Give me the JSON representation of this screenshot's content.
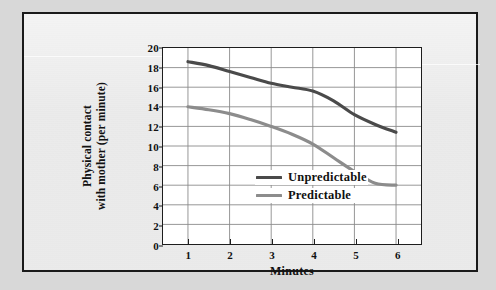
{
  "figure": {
    "background_color": "#d8d8d8",
    "plate_color": "#e6e6e6",
    "border_color": "#1a1a1a"
  },
  "chart_data": {
    "type": "line",
    "title": "",
    "subtitle": "",
    "xlabel": "Minutes",
    "ylabel": "Physical contact with mother (per minute)",
    "ylabel_line1": "Physical contact",
    "ylabel_line2": "with mother (per minute)",
    "xlim": [
      0.4,
      6.6
    ],
    "ylim": [
      0,
      20
    ],
    "x_ticks": [
      1,
      2,
      3,
      4,
      5,
      6
    ],
    "x_tick_labels": [
      "1",
      "2",
      "3",
      "4",
      "5",
      "6"
    ],
    "y_ticks": [
      0,
      2,
      4,
      6,
      8,
      10,
      12,
      14,
      16,
      18,
      20
    ],
    "y_tick_labels": [
      "0",
      "2",
      "4",
      "6",
      "8",
      "10",
      "12",
      "14",
      "16",
      "18",
      "20"
    ],
    "grid": true,
    "grid_color": "#8a8a8a",
    "legend_position": "center",
    "x": [
      1,
      1.5,
      2,
      2.5,
      3,
      3.5,
      4,
      4.5,
      5,
      5.5,
      6
    ],
    "series": [
      {
        "name": "Unpredictable",
        "color": "#4a4a4a",
        "values": [
          18.6,
          18.2,
          17.6,
          17.0,
          16.4,
          16.0,
          15.6,
          14.6,
          13.2,
          12.2,
          11.4
        ]
      },
      {
        "name": "Predictable",
        "color": "#8c8c8c",
        "values": [
          14.0,
          13.7,
          13.3,
          12.7,
          12.0,
          11.2,
          10.2,
          8.8,
          7.4,
          6.2,
          6.0
        ]
      }
    ]
  },
  "legend": {
    "items": [
      {
        "label": "Unpredictable",
        "color": "#4a4a4a"
      },
      {
        "label": "Predictable",
        "color": "#8c8c8c"
      }
    ]
  }
}
